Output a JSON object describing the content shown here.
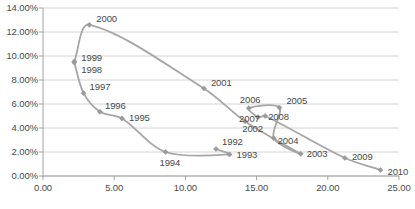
{
  "chart_data": {
    "type": "line",
    "title": "",
    "subtitle": "",
    "xlabel": "",
    "ylabel": "",
    "xlim": [
      0.0,
      25.0
    ],
    "ylim": [
      0.0,
      0.14
    ],
    "grid": true,
    "legend": false,
    "legend_position": "none",
    "xticks": [
      "0.00",
      "5.00",
      "10.00",
      "15.00",
      "20.00",
      "25.00"
    ],
    "xtick_values": [
      0.0,
      5.0,
      10.0,
      15.0,
      20.0,
      25.0
    ],
    "yticks": [
      "0.00%",
      "2.00%",
      "4.00%",
      "6.00%",
      "8.00%",
      "10.00%",
      "12.00%",
      "14.00%"
    ],
    "ytick_values": [
      0.0,
      0.02,
      0.04,
      0.06,
      0.08,
      0.1,
      0.12,
      0.14
    ],
    "series": [
      {
        "name": "trajectory",
        "marker": "diamond",
        "color": "#a6a6a6",
        "points": [
          {
            "label": "1992",
            "x": 12.15,
            "y": 0.0225,
            "label_dx": 6,
            "label_dy": -12
          },
          {
            "label": "1993",
            "x": 13.1,
            "y": 0.018,
            "label_dx": 7,
            "label_dy": -4
          },
          {
            "label": "1994",
            "x": 8.6,
            "y": 0.02,
            "label_dx": -6,
            "label_dy": 6
          },
          {
            "label": "1995",
            "x": 5.55,
            "y": 0.048,
            "label_dx": 7,
            "label_dy": 0
          },
          {
            "label": "1996",
            "x": 4.0,
            "y": 0.0535,
            "label_dx": 5,
            "label_dy": -11
          },
          {
            "label": "1997",
            "x": 2.85,
            "y": 0.069,
            "label_dx": 6,
            "label_dy": -11
          },
          {
            "label": "1998",
            "x": 2.2,
            "y": 0.0945,
            "label_dx": 7,
            "label_dy": 2
          },
          {
            "label": "1999",
            "x": 2.2,
            "y": 0.0955,
            "label_dx": 7,
            "label_dy": -8
          },
          {
            "label": "2000",
            "x": 3.25,
            "y": 0.126,
            "label_dx": 7,
            "label_dy": -11
          },
          {
            "label": "2001",
            "x": 11.3,
            "y": 0.073,
            "label_dx": 7,
            "label_dy": -10
          },
          {
            "label": "2002",
            "x": 14.2,
            "y": 0.0455,
            "label_dx": -3,
            "label_dy": 3
          },
          {
            "label": "2003",
            "x": 18.1,
            "y": 0.0185,
            "label_dx": 6,
            "label_dy": -5
          },
          {
            "label": "2004",
            "x": 16.2,
            "y": 0.0315,
            "label_dx": 4,
            "label_dy": -2
          },
          {
            "label": "2005",
            "x": 16.6,
            "y": 0.057,
            "label_dx": 7,
            "label_dy": -12
          },
          {
            "label": "2006",
            "x": 14.45,
            "y": 0.0565,
            "label_dx": -9,
            "label_dy": -13
          },
          {
            "label": "2007",
            "x": 15.1,
            "y": 0.049,
            "label_dx": -19,
            "label_dy": -3
          },
          {
            "label": "2008",
            "x": 15.6,
            "y": 0.05,
            "label_dx": 3,
            "label_dy": -4
          },
          {
            "label": "2009",
            "x": 21.2,
            "y": 0.015,
            "label_dx": 7,
            "label_dy": -6
          },
          {
            "label": "2010",
            "x": 23.7,
            "y": 0.005,
            "label_dx": 7,
            "label_dy": -3
          }
        ],
        "path_order": [
          "1992",
          "1993",
          "1994",
          "1995",
          "1996",
          "1997",
          "1998",
          "1999",
          "2000",
          "2001",
          "2002",
          "2003",
          "2004",
          "2005",
          "2006",
          "2007",
          "2008",
          "2009",
          "2010"
        ]
      }
    ]
  },
  "style": {
    "line_color": "#a6a6a6",
    "marker_color": "#9a9a9a",
    "grid_color": "#c9c9c9",
    "axis_color": "#9a9a9a",
    "text_color": "#4a4a4a",
    "background": "#ffffff"
  }
}
